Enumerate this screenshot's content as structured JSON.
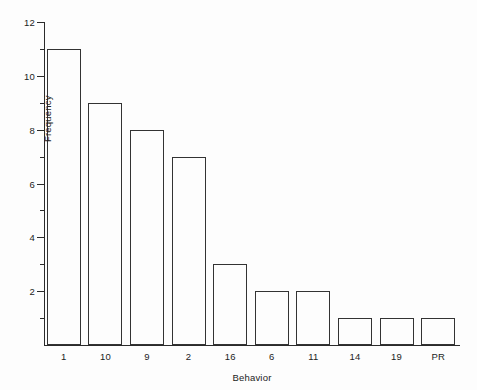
{
  "chart_data": {
    "type": "bar",
    "title": "",
    "subtitle": "",
    "xlabel": "Behavior",
    "ylabel": "Frequency",
    "categories": [
      "1",
      "10",
      "9",
      "2",
      "16",
      "6",
      "11",
      "14",
      "19",
      "PR"
    ],
    "values": [
      11,
      9,
      8,
      7,
      3,
      2,
      2,
      1,
      1,
      1
    ],
    "series": [
      {
        "name": "Frequency",
        "values": [
          11,
          9,
          8,
          7,
          3,
          2,
          2,
          1,
          1,
          1
        ]
      }
    ],
    "ylim": [
      0,
      12
    ],
    "xlim_note": "categorical",
    "y_major_ticks": [
      0,
      2,
      4,
      6,
      8,
      10,
      12
    ],
    "y_minor_ticks": [
      1,
      3,
      5,
      7,
      9,
      11
    ],
    "y_tick_labels": [
      "2",
      "4",
      "6",
      "8",
      "10",
      "12"
    ],
    "grid": false,
    "legend": false,
    "legend_position": "none",
    "bar_fill": "#fdfdfd",
    "bar_edge_color": "#333333",
    "axis_color": "#2b2b2b",
    "background_color": "#fdfdfd",
    "annotations": []
  },
  "axes": {
    "y": {
      "label": "Frequency",
      "ticks": [
        {
          "value": 12,
          "label": "12",
          "kind": "major"
        },
        {
          "value": 11,
          "label": "",
          "kind": "minor"
        },
        {
          "value": 10,
          "label": "10",
          "kind": "major"
        },
        {
          "value": 9,
          "label": "",
          "kind": "minor"
        },
        {
          "value": 8,
          "label": "8",
          "kind": "major"
        },
        {
          "value": 7,
          "label": "",
          "kind": "minor"
        },
        {
          "value": 6,
          "label": "6",
          "kind": "major"
        },
        {
          "value": 5,
          "label": "",
          "kind": "minor"
        },
        {
          "value": 4,
          "label": "4",
          "kind": "major"
        },
        {
          "value": 3,
          "label": "",
          "kind": "minor"
        },
        {
          "value": 2,
          "label": "2",
          "kind": "major"
        },
        {
          "value": 1,
          "label": "",
          "kind": "minor"
        }
      ]
    },
    "x": {
      "label": "Behavior"
    }
  }
}
